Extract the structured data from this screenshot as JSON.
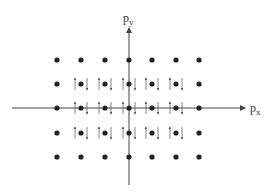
{
  "diagram": {
    "axes": {
      "x_label": "p",
      "x_subscript": "x",
      "y_label": "p",
      "y_subscript": "y",
      "origin": [
        129,
        108
      ],
      "x_extent": [
        12,
        245
      ],
      "y_extent": [
        28,
        185
      ],
      "color": "#444444"
    },
    "lattice": {
      "columns_x": [
        57,
        81,
        105,
        129,
        152,
        176,
        199
      ],
      "rows_y": [
        60,
        84,
        108,
        133,
        157
      ],
      "dot_radius": 2.6,
      "dot_color": "#222222"
    },
    "spin_states": {
      "description": "Interior lattice points each occupied by an up-spin and a down-spin",
      "occupied_columns": [
        1,
        2,
        3,
        4,
        5
      ],
      "occupied_rows": [
        1,
        2,
        3
      ],
      "arrow_color": "#666666"
    }
  }
}
